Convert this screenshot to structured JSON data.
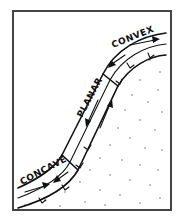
{
  "diagram": {
    "type": "hillslope-profile",
    "labels": {
      "convex": "CONVEX",
      "planar": "PLANAR",
      "concave": "CONCAVE"
    },
    "segments": [
      {
        "name": "convex",
        "position": "upper slope (crest)"
      },
      {
        "name": "planar",
        "position": "mid slope"
      },
      {
        "name": "concave",
        "position": "lower slope (footslope)"
      }
    ],
    "arrows": [
      {
        "segment": "convex",
        "upper_flow": "right (upslope)",
        "lower_flow": "down-left"
      },
      {
        "segment": "planar",
        "upper_flow": "down",
        "lower_flow": "up"
      },
      {
        "segment": "concave",
        "upper_flow": "down-left",
        "lower_flow": "right"
      }
    ],
    "fill": "stippled subsurface (dots)",
    "colors": {
      "stroke": "#111111",
      "frame": "#444444",
      "background": "#ffffff"
    }
  }
}
